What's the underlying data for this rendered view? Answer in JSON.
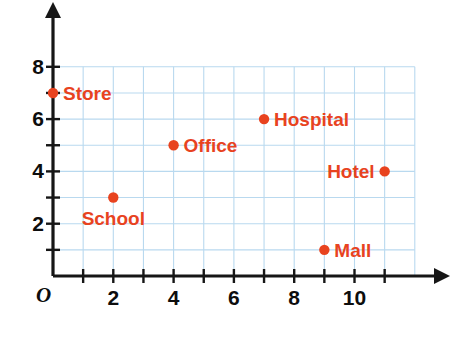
{
  "chart_data": {
    "type": "scatter",
    "title": "",
    "xlabel": "",
    "ylabel": "",
    "xlim": [
      0,
      12
    ],
    "ylim": [
      0,
      8
    ],
    "grid": true,
    "grid_color": "#b9d9ef",
    "point_color": "#e8431f",
    "label_color": "#e8431f",
    "axis_color": "#161616",
    "legend": "none",
    "origin_label": "O",
    "x_ticks": [
      1,
      2,
      3,
      4,
      5,
      6,
      7,
      8,
      9,
      10,
      11
    ],
    "x_tick_labels": [
      "2",
      "4",
      "6",
      "8",
      "10"
    ],
    "x_tick_label_values": [
      2,
      4,
      6,
      8,
      10
    ],
    "y_ticks": [
      1,
      2,
      3,
      4,
      5,
      6,
      7,
      8
    ],
    "y_tick_labels": [
      "2",
      "4",
      "6",
      "8"
    ],
    "y_tick_label_values": [
      2,
      4,
      6,
      8
    ],
    "points": [
      {
        "name": "Store",
        "x": 0,
        "y": 7,
        "label": "Store",
        "label_pos": "right"
      },
      {
        "name": "School",
        "x": 2,
        "y": 3,
        "label": "School",
        "label_pos": "below"
      },
      {
        "name": "Office",
        "x": 4,
        "y": 5,
        "label": "Office",
        "label_pos": "right"
      },
      {
        "name": "Hospital",
        "x": 7,
        "y": 6,
        "label": "Hospital",
        "label_pos": "right"
      },
      {
        "name": "Hotel",
        "x": 11,
        "y": 4,
        "label": "Hotel",
        "label_pos": "left"
      },
      {
        "name": "Mall",
        "x": 9,
        "y": 1,
        "label": "Mall",
        "label_pos": "right"
      }
    ]
  }
}
